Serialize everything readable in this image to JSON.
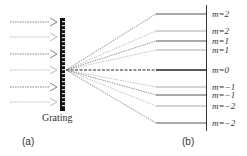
{
  "figure": {
    "panel_a_label": "(a)",
    "panel_b_label": "(b)",
    "grating_label": "Grating",
    "incident_rays": [
      {
        "y": 22,
        "shade": "dark"
      },
      {
        "y": 37,
        "shade": "light"
      },
      {
        "y": 54,
        "shade": "dark"
      },
      {
        "y": 70,
        "shade": "light"
      },
      {
        "y": 87,
        "shade": "dark"
      },
      {
        "y": 102,
        "shade": "light"
      }
    ],
    "orders": [
      {
        "m": "m=2",
        "y": 14,
        "shade": "dark"
      },
      {
        "m": "m=2",
        "y": 31,
        "shade": "light"
      },
      {
        "m": "m=1",
        "y": 41,
        "shade": "dark"
      },
      {
        "m": "m=1",
        "y": 50,
        "shade": "light"
      },
      {
        "m": "m=0",
        "y": 70,
        "shade": "black"
      },
      {
        "m": "m=−1",
        "y": 87,
        "shade": "light"
      },
      {
        "m": "m=−1",
        "y": 95,
        "shade": "dark"
      },
      {
        "m": "m=−2",
        "y": 106,
        "shade": "light"
      },
      {
        "m": "m=−2",
        "y": 123,
        "shade": "dark"
      }
    ],
    "colors": {
      "dark": "#555555",
      "light": "#aaaaaa",
      "black": "#222222"
    }
  }
}
